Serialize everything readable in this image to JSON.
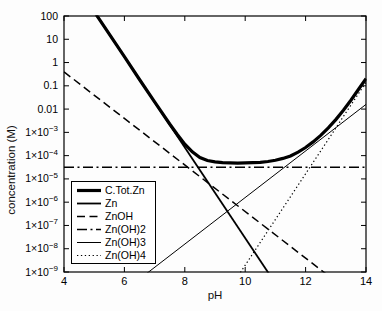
{
  "figure": {
    "background": "#fdfdfd",
    "line_color": "#000000",
    "legend_bg": "#ffffff"
  },
  "chart_data": {
    "type": "line",
    "title": "",
    "xlabel": "pH",
    "ylabel": "concentration (M)",
    "x_axis": {
      "min": 4,
      "max": 14,
      "ticks": [
        4,
        6,
        8,
        10,
        12,
        14
      ]
    },
    "y_axis": {
      "scale": "log10",
      "min_exp": -9,
      "max_exp": 2,
      "tick_labels": [
        {
          "exp": 2,
          "text": "100"
        },
        {
          "exp": 1,
          "text": "10"
        },
        {
          "exp": 0,
          "text": "1"
        },
        {
          "exp": -1,
          "text": "0.1"
        },
        {
          "exp": -2,
          "text": "0.01"
        },
        {
          "exp": -3,
          "base": "1×10",
          "sup": "−3"
        },
        {
          "exp": -4,
          "base": "1×10",
          "sup": "−4"
        },
        {
          "exp": -5,
          "base": "1×10",
          "sup": "−5"
        },
        {
          "exp": -6,
          "base": "1×10",
          "sup": "−6"
        },
        {
          "exp": -7,
          "base": "1×10",
          "sup": "−7"
        },
        {
          "exp": -8,
          "base": "1×10",
          "sup": "−8"
        },
        {
          "exp": -9,
          "base": "1×10",
          "sup": "−9"
        }
      ]
    },
    "legend": {
      "position": "bottom-left",
      "entries": [
        "C.Tot.Zn",
        "Zn",
        "ZnOH",
        "Zn(OH)2",
        "Zn(OH)3",
        "Zn(OH)4"
      ]
    },
    "series": [
      {
        "name": "C.Tot.Zn",
        "style": "thick-solid",
        "points": [
          [
            4,
            4.14
          ],
          [
            4.5,
            3.17
          ],
          [
            5,
            2.19
          ],
          [
            5.5,
            1.22
          ],
          [
            6,
            0.25
          ],
          [
            6.5,
            -0.73
          ],
          [
            7,
            -1.69
          ],
          [
            7.5,
            -2.64
          ],
          [
            7.75,
            -3.09
          ],
          [
            8,
            -3.51
          ],
          [
            8.25,
            -3.84
          ],
          [
            8.5,
            -4.08
          ],
          [
            8.75,
            -4.21
          ],
          [
            9,
            -4.27
          ],
          [
            9.25,
            -4.3
          ],
          [
            9.5,
            -4.31
          ],
          [
            9.75,
            -4.32
          ],
          [
            10,
            -4.31
          ],
          [
            10.25,
            -4.3
          ],
          [
            10.5,
            -4.29
          ],
          [
            10.75,
            -4.25
          ],
          [
            11,
            -4.2
          ],
          [
            11.25,
            -4.12
          ],
          [
            11.5,
            -4.01
          ],
          [
            11.75,
            -3.85
          ],
          [
            12,
            -3.65
          ],
          [
            12.25,
            -3.41
          ],
          [
            12.5,
            -3.13
          ],
          [
            12.75,
            -2.81
          ],
          [
            13,
            -2.45
          ],
          [
            13.25,
            -2.05
          ],
          [
            13.5,
            -1.62
          ],
          [
            13.75,
            -1.16
          ],
          [
            14,
            -0.69
          ]
        ]
      },
      {
        "name": "Zn",
        "style": "solid",
        "points": [
          [
            4,
            4.14
          ],
          [
            11,
            -9.49
          ]
        ]
      },
      {
        "name": "ZnOH",
        "style": "dashed",
        "points": [
          [
            4,
            -0.4
          ],
          [
            13.2,
            -9.6
          ]
        ]
      },
      {
        "name": "Zn(OH)2",
        "style": "dash-dot",
        "points": [
          [
            4,
            -4.5
          ],
          [
            14,
            -4.5
          ]
        ]
      },
      {
        "name": "Zn(OH)3",
        "style": "thin-solid",
        "points": [
          [
            6.6,
            -9.2
          ],
          [
            14,
            -1.8
          ]
        ]
      },
      {
        "name": "Zn(OH)4",
        "style": "dotted",
        "points": [
          [
            9.7,
            -9.3
          ],
          [
            14,
            -0.85
          ]
        ]
      }
    ]
  }
}
